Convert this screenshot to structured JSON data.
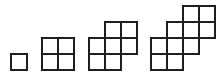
{
  "diagram": {
    "cell_size": 16,
    "stroke_color": "#1e1e1e",
    "figures": [
      {
        "index": 1,
        "square_count": 1,
        "cells": [
          [
            11,
            54
          ]
        ]
      },
      {
        "index": 2,
        "square_count": 4,
        "cells": [
          [
            42,
            38
          ],
          [
            58,
            38
          ],
          [
            42,
            54
          ],
          [
            58,
            54
          ]
        ]
      },
      {
        "index": 3,
        "square_count": 7,
        "cells": [
          [
            105,
            22
          ],
          [
            121,
            22
          ],
          [
            89,
            38
          ],
          [
            105,
            38
          ],
          [
            121,
            38
          ],
          [
            89,
            54
          ],
          [
            105,
            54
          ]
        ]
      },
      {
        "index": 4,
        "square_count": 10,
        "cells": [
          [
            183,
            6
          ],
          [
            199,
            6
          ],
          [
            167,
            22
          ],
          [
            183,
            22
          ],
          [
            199,
            22
          ],
          [
            151,
            38
          ],
          [
            167,
            38
          ],
          [
            183,
            38
          ],
          [
            151,
            54
          ],
          [
            167,
            54
          ]
        ]
      }
    ]
  }
}
